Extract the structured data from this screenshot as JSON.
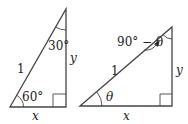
{
  "diagram": {
    "left_triangle": {
      "hypotenuse_label": "1",
      "vertical_label": "y",
      "horizontal_label": "x",
      "bottom_angle_label": "60°",
      "top_angle_label": "30°"
    },
    "right_triangle": {
      "hypotenuse_label": "1",
      "vertical_label": "y",
      "horizontal_label": "x",
      "bottom_angle_label": "θ",
      "top_angle_label": "90° − θ"
    },
    "colors": {
      "stroke": "#444444",
      "background": "#ffffff"
    }
  }
}
